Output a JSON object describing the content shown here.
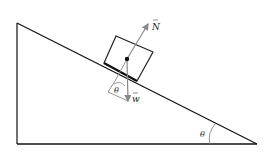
{
  "diagram": {
    "labels": {
      "normal_force": "N",
      "weight": "w",
      "angle_at_block": "θ",
      "angle_at_base": "θ"
    },
    "colors": {
      "incline": "#111111",
      "vectors": "#888888",
      "block": "#222222",
      "background": "#ffffff"
    }
  }
}
